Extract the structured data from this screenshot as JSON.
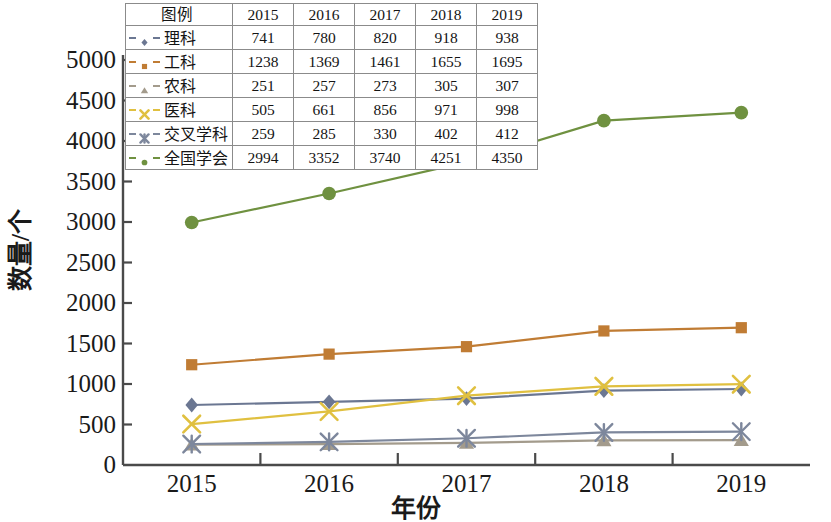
{
  "chart_data": {
    "type": "line",
    "title": "",
    "xlabel": "年份",
    "ylabel": "数量/个",
    "categories": [
      "2015",
      "2016",
      "2017",
      "2018",
      "2019"
    ],
    "ylim": [
      0,
      5000
    ],
    "y_ticks": [
      0,
      500,
      1000,
      1500,
      2000,
      2500,
      3000,
      3500,
      4000,
      4500,
      5000
    ],
    "grid": false,
    "legend_position": "top-left-table",
    "series": [
      {
        "name": "理科",
        "values": [
          741,
          780,
          820,
          918,
          938
        ],
        "color": "#6b7792",
        "marker": "diamond"
      },
      {
        "name": "工科",
        "values": [
          1238,
          1369,
          1461,
          1655,
          1695
        ],
        "color": "#c07c34",
        "marker": "square"
      },
      {
        "name": "农科",
        "values": [
          251,
          257,
          273,
          305,
          307
        ],
        "color": "#a39b8c",
        "marker": "triangle"
      },
      {
        "name": "医科",
        "values": [
          505,
          661,
          856,
          971,
          998
        ],
        "color": "#e0c040",
        "marker": "x"
      },
      {
        "name": "交叉学科",
        "values": [
          259,
          285,
          330,
          402,
          412
        ],
        "color": "#7d879c",
        "marker": "asterisk"
      },
      {
        "name": "全国学会",
        "values": [
          2994,
          3352,
          3740,
          4251,
          4350
        ],
        "color": "#6f9140",
        "marker": "circle"
      }
    ]
  },
  "legend_table": {
    "header": [
      "图例",
      "2015",
      "2016",
      "2017",
      "2018",
      "2019"
    ],
    "rows": [
      {
        "name": "理科",
        "values": [
          "741",
          "780",
          "820",
          "918",
          "938"
        ]
      },
      {
        "name": "工科",
        "values": [
          "1238",
          "1369",
          "1461",
          "1655",
          "1695"
        ]
      },
      {
        "name": "农科",
        "values": [
          "251",
          "257",
          "273",
          "305",
          "307"
        ]
      },
      {
        "name": "医科",
        "values": [
          "505",
          "661",
          "856",
          "971",
          "998"
        ]
      },
      {
        "name": "交叉学科",
        "values": [
          "259",
          "285",
          "330",
          "402",
          "412"
        ]
      },
      {
        "name": "全国学会",
        "values": [
          "2994",
          "3352",
          "3740",
          "4251",
          "4350"
        ]
      }
    ]
  },
  "axes": {
    "y_tick_labels": [
      "5000",
      "4500",
      "4000",
      "3500",
      "3000",
      "2500",
      "2000",
      "1500",
      "1000",
      "500",
      "0"
    ],
    "x_tick_labels": [
      "2015",
      "2016",
      "2017",
      "2018",
      "2019"
    ],
    "y_title": "数量/个",
    "x_title": "年份",
    "axis_color": "#4a4a4a"
  }
}
